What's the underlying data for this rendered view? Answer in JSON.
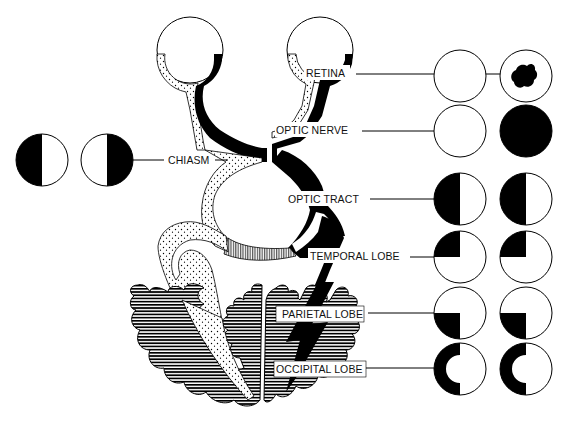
{
  "diagram": {
    "labels": {
      "retina": "RETINA",
      "optic_nerve": "OPTIC NERVE",
      "chiasm": "CHIASM",
      "optic_tract": "OPTIC TRACT",
      "temporal_lobe": "TEMPORAL LOBE",
      "parietal_lobe": "PARIETAL LOBE",
      "occipital_lobe": "OCCIPITAL LOBE"
    },
    "field_defects": [
      {
        "site": "retina",
        "left_eye": "normal",
        "right_eye": "central scotoma"
      },
      {
        "site": "optic nerve",
        "left_eye": "normal",
        "right_eye": "total blindness"
      },
      {
        "site": "chiasm",
        "left_eye": "temporal hemianopia",
        "right_eye": "temporal hemianopia"
      },
      {
        "site": "optic tract",
        "left_eye": "left homonymous hemianopia",
        "right_eye": "left homonymous hemianopia"
      },
      {
        "site": "temporal lobe",
        "left_eye": "upper left quadrantanopia",
        "right_eye": "upper left quadrantanopia"
      },
      {
        "site": "parietal lobe",
        "left_eye": "lower left quadrantanopia",
        "right_eye": "lower left quadrantanopia"
      },
      {
        "site": "occipital lobe",
        "left_eye": "left hemianopia with macular sparing",
        "right_eye": "left hemianopia with macular sparing"
      }
    ],
    "colors": {
      "ink": "#000000",
      "paper": "#ffffff"
    }
  }
}
